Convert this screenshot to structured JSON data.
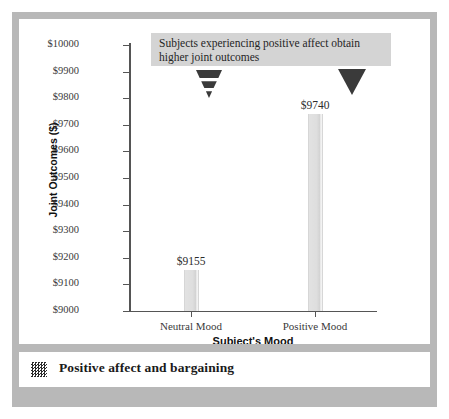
{
  "figure": {
    "caption": "Positive affect and bargaining",
    "caption_icon": "dithered-thumbnail-icon",
    "frame_color": "#b8b8b8",
    "panel_color": "#ffffff"
  },
  "annotation": {
    "text": "Subjects experiencing positive affect obtain higher joint outcomes",
    "background": "#d4d4d4",
    "markers": [
      {
        "name": "sliced-triangle-marker",
        "style": "sliced",
        "points_to": "Neutral Mood"
      },
      {
        "name": "solid-triangle-marker",
        "style": "solid",
        "points_to": "Positive Mood"
      }
    ]
  },
  "chart_data": {
    "type": "bar",
    "title": "",
    "xlabel": "Subject's Mood",
    "ylabel": "Joint Outcomes ($)",
    "categories": [
      "Neutral Mood",
      "Positive Mood"
    ],
    "values": [
      9155,
      9740
    ],
    "value_labels": [
      "$9155",
      "$9740"
    ],
    "ylim": [
      9000,
      10000
    ],
    "ytick_step": 100,
    "ytick_labels": [
      "$10000",
      "$9900",
      "$9800",
      "$9700",
      "$9600",
      "$9500",
      "$9400",
      "$9300",
      "$9200",
      "$9100",
      "$9000"
    ],
    "ytick_values": [
      10000,
      9900,
      9800,
      9700,
      9600,
      9500,
      9400,
      9300,
      9200,
      9100,
      9000
    ],
    "grid": false,
    "legend": false,
    "bar_color": "#dedede",
    "axis_color": "#555555"
  }
}
